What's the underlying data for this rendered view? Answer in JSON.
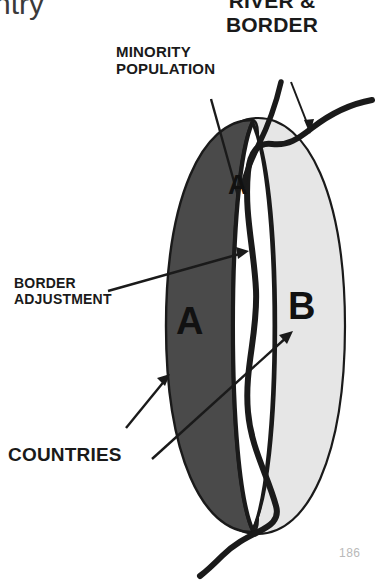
{
  "page": {
    "cut_off_title": "ntry",
    "page_number": "186"
  },
  "labels": {
    "river_border": "RIVER &\nBORDER",
    "minority_population": "MINORITY\nPOPULATION",
    "border_adjustment": "BORDER\nADJUSTMENT",
    "countries": "COUNTRIES"
  },
  "map": {
    "region_a_letter": "A",
    "region_b_letter": "B",
    "minority_enclave_letter": "A"
  },
  "colors": {
    "country_a_fill": "#4a4a4a",
    "country_b_fill": "#e6e6e6",
    "minority_strip_fill": "#ffffff",
    "outline": "#1a1a1a",
    "river": "#1a1a1a",
    "page_number": "#b9b9b9",
    "background": "#ffffff"
  },
  "icons": {
    "river_border_pointer": "arrow-down-right-icon",
    "minority_pointer": "leader-line-icon",
    "border_adjustment_pointer": "arrow-right-icon",
    "countries_pointer_a": "arrow-up-right-icon",
    "countries_pointer_b": "arrow-up-right-icon"
  }
}
